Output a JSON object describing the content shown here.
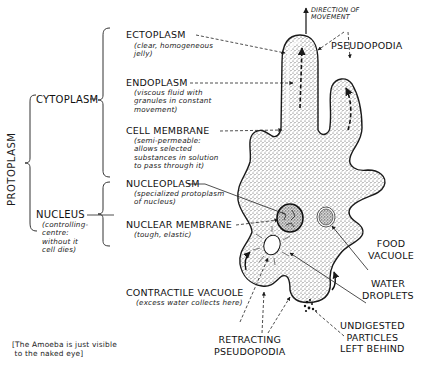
{
  "diagram": {
    "subject": "Amoeba",
    "direction_label": "DIRECTION OF\nMOVEMENT",
    "groups": {
      "protoplasm": "PROTOPLASM",
      "cytoplasm": "CYTOPLASM",
      "nucleus": {
        "label": "NUCLEUS",
        "note": "(controlling-\ncentre:\nwithout it\ncell dies)"
      }
    },
    "labels": {
      "ectoplasm": {
        "label": "ECTOPLASM",
        "note": "(clear, homogeneous\njelly)"
      },
      "endoplasm": {
        "label": "ENDOPLASM",
        "note": "(viscous fluid with\ngranules in constant\nmovement)"
      },
      "cell_membrane": {
        "label": "CELL MEMBRANE",
        "note": "(semi-permeable:\nallows selected\nsubstances in solution\nto pass through it)"
      },
      "nucleoplasm": {
        "label": "NUCLEOPLASM",
        "note": "(specialized protoplasm\nof nucleus)"
      },
      "nuclear_membrane": {
        "label": "NUCLEAR MEMBRANE",
        "note": "(tough, elastic)"
      },
      "contractile_vacuole": {
        "label": "CONTRACTILE VACUOLE",
        "note": "(excess water collects here)"
      },
      "pseudopodia": {
        "label": "PSEUDOPODIA"
      },
      "food_vacuole": {
        "label": "FOOD\nVACUOLE"
      },
      "water_droplets": {
        "label": "WATER\nDROPLETS"
      },
      "retracting_pseudopodia": {
        "label": "RETRACTING\nPSEUDOPODIA"
      },
      "undigested_particles": {
        "label": "UNDIGESTED\nPARTICLES\nLEFT BEHIND"
      }
    },
    "footnote": "[The Amoeba is just visible\n to the naked eye]",
    "colors": {
      "ink": "#1a1a1a",
      "stipple": "#555555",
      "background": "#ffffff"
    }
  }
}
